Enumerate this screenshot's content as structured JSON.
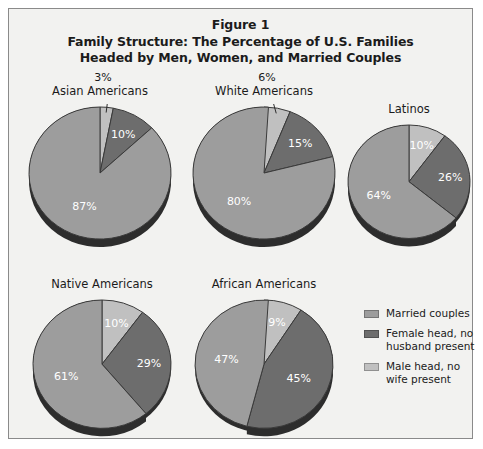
{
  "figure": {
    "number_label": "Figure 1",
    "title_line_1": "Family Structure: The Percentage of U.S. Families",
    "title_line_2": "Headed by Men, Women, and Married Couples"
  },
  "colors": {
    "married": "#9d9d9d",
    "female_head": "#6d6d6d",
    "male_head": "#c0c0c0",
    "shadow": "#2d2d2d",
    "frame_border": "#8a8a8a",
    "panel_background": "#f2f2f0",
    "label_text": "#1b1b1b",
    "value_text": "#ffffff"
  },
  "legend": {
    "items": [
      {
        "label": "Married couples",
        "key": "married",
        "color": "#9d9d9d"
      },
      {
        "label": "Female head, no husband present",
        "key": "female_head",
        "color": "#6d6d6d"
      },
      {
        "label": "Male head, no wife present",
        "key": "male_head",
        "color": "#c0c0c0"
      }
    ]
  },
  "chart_data": {
    "type": "pie",
    "title": "Family Structure: The Percentage of U.S. Families Headed by Men, Women, and Married Couples",
    "subtitle": "Figure 1",
    "units": "percent",
    "legend_position": "right",
    "categories": [
      "Male head, no wife present",
      "Female head, no husband present",
      "Married couples"
    ],
    "charts": [
      {
        "name": "Asian Americans",
        "slices": [
          {
            "label": "Male head, no wife present",
            "value": 3,
            "display": "3%",
            "key": "male_head"
          },
          {
            "label": "Female head, no husband present",
            "value": 10,
            "display": "10%",
            "key": "female_head"
          },
          {
            "label": "Married couples",
            "value": 87,
            "display": "87%",
            "key": "married"
          }
        ]
      },
      {
        "name": "White Americans",
        "slices": [
          {
            "label": "Male head, no wife present",
            "value": 6,
            "display": "6%",
            "key": "male_head"
          },
          {
            "label": "Female head, no husband present",
            "value": 15,
            "display": "15%",
            "key": "female_head"
          },
          {
            "label": "Married couples",
            "value": 80,
            "display": "80%",
            "key": "married"
          }
        ]
      },
      {
        "name": "Latinos",
        "slices": [
          {
            "label": "Male head, no wife present",
            "value": 10,
            "display": "10%",
            "key": "male_head"
          },
          {
            "label": "Female head, no husband present",
            "value": 26,
            "display": "26%",
            "key": "female_head"
          },
          {
            "label": "Married couples",
            "value": 64,
            "display": "64%",
            "key": "married"
          }
        ]
      },
      {
        "name": "Native Americans",
        "slices": [
          {
            "label": "Male head, no wife present",
            "value": 10,
            "display": "10%",
            "key": "male_head"
          },
          {
            "label": "Female head, no husband present",
            "value": 29,
            "display": "29%",
            "key": "female_head"
          },
          {
            "label": "Married couples",
            "value": 61,
            "display": "61%",
            "key": "married"
          }
        ]
      },
      {
        "name": "African Americans",
        "slices": [
          {
            "label": "Male head, no wife present",
            "value": 9,
            "display": "9%",
            "key": "male_head"
          },
          {
            "label": "Female head, no husband present",
            "value": 45,
            "display": "45%",
            "key": "female_head"
          },
          {
            "label": "Married couples",
            "value": 47,
            "display": "47%",
            "key": "married"
          }
        ]
      }
    ]
  },
  "layout": {
    "pies": [
      {
        "chart_index": 0,
        "left": 18,
        "top": 95,
        "size": 146,
        "label_top": -20,
        "callout": true,
        "callout_text_x": 74,
        "callout_text_y": -33
      },
      {
        "chart_index": 1,
        "left": 182,
        "top": 95,
        "size": 146,
        "label_top": -20,
        "callout": true,
        "callout_text_x": 74,
        "callout_text_y": -33
      },
      {
        "chart_index": 2,
        "left": 337,
        "top": 113,
        "size": 126,
        "label_top": -20,
        "callout": false
      },
      {
        "chart_index": 3,
        "left": 22,
        "top": 288,
        "size": 142,
        "label_top": -20,
        "callout": false
      },
      {
        "chart_index": 4,
        "left": 184,
        "top": 288,
        "size": 142,
        "label_top": -20,
        "callout": false
      }
    ]
  }
}
